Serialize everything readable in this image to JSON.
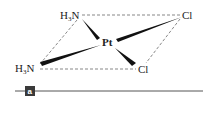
{
  "figure": {
    "molecule": "cisplatin",
    "center_atom": "Pt",
    "ligands": [
      {
        "id": "nh3_top",
        "label_main": "H",
        "label_sub": "3",
        "label_end": "N"
      },
      {
        "id": "nh3_bottom",
        "label_main": "H",
        "label_sub": "3",
        "label_end": "N"
      },
      {
        "id": "cl_top",
        "label": "Cl"
      },
      {
        "id": "cl_bottom",
        "label": "Cl"
      }
    ],
    "panel_label": "a",
    "colors": {
      "ink": "#222222",
      "dash": "#555555",
      "tag_bg": "#3a3a3a"
    }
  }
}
